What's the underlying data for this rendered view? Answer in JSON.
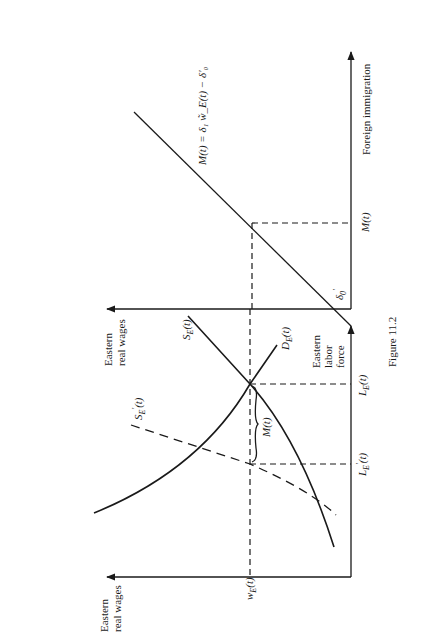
{
  "figure": {
    "caption": "Figure 11.2",
    "orientation": "rotated 90° clockwise on page"
  },
  "left_panel": {
    "y_axis_label_line1": "Eastern",
    "y_axis_label_line2": "real wages",
    "x_axis_label_line1": "Eastern",
    "x_axis_label_line2": "labor",
    "x_axis_label_line3": "force",
    "wage_tick": "w",
    "wage_tick_sub": "E",
    "wage_tick_arg": "(t)",
    "tick_LE_prime": "L",
    "tick_LE_prime_sub": "E",
    "tick_LE_prime_sup": "′",
    "tick_LE_prime_arg": "(t)",
    "tick_LE": "L",
    "tick_LE_sub": "E",
    "tick_LE_arg": "(t)",
    "curve_SE": "S",
    "curve_SE_sub": "E",
    "curve_SE_arg": "(t)",
    "curve_SE_prime": "S",
    "curve_SE_prime_sub": "E",
    "curve_SE_prime_sup": "′",
    "curve_SE_prime_arg": "(t)",
    "curve_DE": "D",
    "curve_DE_sub": "E",
    "curve_DE_arg": "(t)",
    "brace_label": "M(t)"
  },
  "right_panel": {
    "y_axis_label_line1": "Eastern",
    "y_axis_label_line2": "real wages",
    "x_axis_label": "Foreign immigration",
    "tick_M": "M(t)",
    "intercept_label": "δ",
    "intercept_sub": "0",
    "intercept_sup": "′",
    "line_equation": "M(t) = δ₁ w̃_E(t) − δ′₀"
  }
}
